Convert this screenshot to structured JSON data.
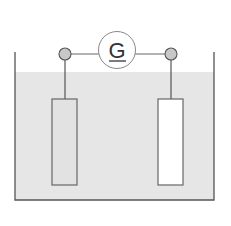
{
  "diagram": {
    "galvanometer": {
      "label": "G"
    },
    "colors": {
      "liquid": "#e6e6e6",
      "line": "#555555",
      "terminal": "#c8c8c8",
      "left_electrode": "#e2e2e2",
      "right_electrode": "#ffffff",
      "background": "#ffffff"
    },
    "components": [
      "beaker",
      "electrolyte",
      "left-electrode",
      "right-electrode",
      "left-terminal",
      "right-terminal",
      "galvanometer",
      "wires"
    ]
  }
}
